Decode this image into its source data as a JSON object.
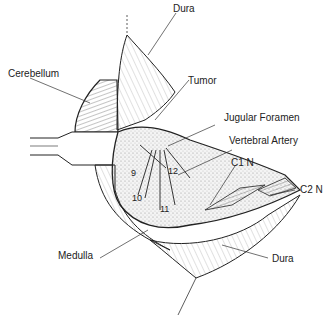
{
  "figure": {
    "type": "anatomical illustration",
    "labels": {
      "dura_top": "Dura",
      "cerebellum": "Cerebellum",
      "tumor": "Tumor",
      "jugular_foramen": "Jugular Foramen",
      "vertebral_artery": "Vertebral Artery",
      "c1n": "C1 N",
      "c2n": "C2 N",
      "medulla": "Medulla",
      "dura_bottom": "Dura"
    },
    "nerve_numbers": {
      "n9": "9",
      "n10": "10",
      "n11": "11",
      "n12": "12"
    },
    "colors": {
      "ink": "#222222",
      "background": "#ffffff",
      "stipple": "#cfcfcf"
    }
  }
}
